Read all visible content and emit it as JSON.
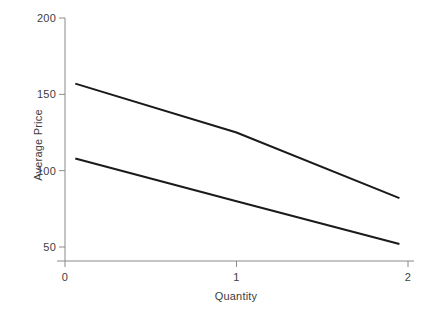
{
  "chart_data": {
    "type": "line",
    "title": "",
    "xlabel": "Quantity",
    "ylabel": "Average Price",
    "xlim": [
      -0.02,
      2.05
    ],
    "ylim": [
      42,
      205
    ],
    "xticks": [
      0,
      1,
      2
    ],
    "xtick_labels": [
      "0",
      "1",
      "2"
    ],
    "yticks": [
      50,
      100,
      150,
      200
    ],
    "ytick_labels": [
      "50",
      "100",
      "150",
      "200"
    ],
    "grid": false,
    "legend": "none",
    "line_color": "#1a1a1a",
    "axis_color": "#8a8a8a",
    "background": "#ffffff",
    "series": [
      {
        "name": "upper-line",
        "x": [
          0.06,
          1.0,
          1.95
        ],
        "values": [
          157,
          125,
          82
        ]
      },
      {
        "name": "lower-line",
        "x": [
          0.06,
          1.0,
          1.95
        ],
        "values": [
          108,
          80,
          52
        ]
      }
    ]
  },
  "axes": {
    "y": {
      "label": "Average Price",
      "ticks": [
        {
          "label": "200",
          "value": 200
        },
        {
          "label": "150",
          "value": 150
        },
        {
          "label": "100",
          "value": 100
        },
        {
          "label": "50",
          "value": 50
        }
      ]
    },
    "x": {
      "label": "Quantity",
      "ticks": [
        {
          "label": "0",
          "value": 0
        },
        {
          "label": "1",
          "value": 1
        },
        {
          "label": "2",
          "value": 2
        }
      ]
    }
  }
}
